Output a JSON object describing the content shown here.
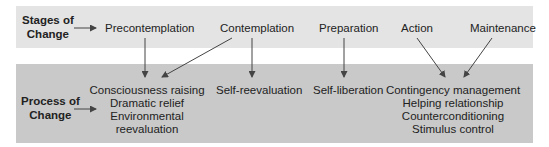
{
  "stages_label": [
    "Stages of",
    "Change"
  ],
  "process_label": [
    "Process of",
    "Change"
  ],
  "stages": {
    "precontemplation": "Precontemplation",
    "contemplation": "Contemplation",
    "preparation": "Preparation",
    "action": "Action",
    "maintenance": "Maintenance"
  },
  "processes": {
    "group1": [
      "Consciousness raising",
      "Dramatic relief",
      "Environmental",
      "reevaluation"
    ],
    "group2": "Self-reevaluation",
    "group3": "Self-liberation",
    "group4": [
      "Contingency management",
      "Helping relationship",
      "Counterconditioning",
      "Stimulus control"
    ]
  },
  "colors": {
    "top_band": "#e4e4e4",
    "bottom_band": "#c9c9c9",
    "arrow": "#444444"
  }
}
